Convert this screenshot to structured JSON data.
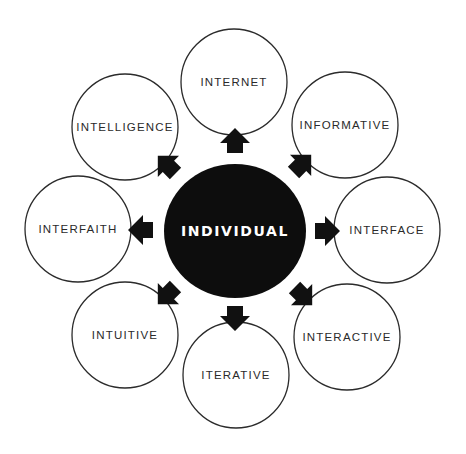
{
  "diagram": {
    "type": "radial-concept-map",
    "center": {
      "label": "INDIVIDUAL"
    },
    "nodes": [
      {
        "id": "internet",
        "label": "INTERNET",
        "direction": "up"
      },
      {
        "id": "informative",
        "label": "INFORMATIVE",
        "direction": "up-right"
      },
      {
        "id": "interface",
        "label": "INTERFACE",
        "direction": "right"
      },
      {
        "id": "interactive",
        "label": "INTERACTIVE",
        "direction": "down-right"
      },
      {
        "id": "iterative",
        "label": "ITERATIVE",
        "direction": "down"
      },
      {
        "id": "intuitive",
        "label": "INTUITIVE",
        "direction": "down-left"
      },
      {
        "id": "interfaith",
        "label": "INTERFAITH",
        "direction": "left"
      },
      {
        "id": "intelligence",
        "label": "INTELLIGENCE",
        "direction": "up-left"
      }
    ],
    "colors": {
      "center_fill": "#0d0d0d",
      "center_text": "#ffffff",
      "outline": "#2b2b2b",
      "arrow": "#111111"
    }
  }
}
